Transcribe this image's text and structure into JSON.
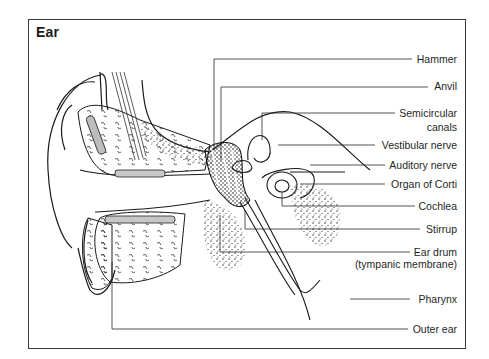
{
  "figure": {
    "title": "Ear",
    "labels": [
      {
        "id": "hammer",
        "text": "Hammer"
      },
      {
        "id": "anvil",
        "text": "Anvil"
      },
      {
        "id": "semicircular-canals",
        "text": "Semicircular",
        "text2": "canals"
      },
      {
        "id": "vestibular-nerve",
        "text": "Vestibular  nerve"
      },
      {
        "id": "auditory-nerve",
        "text": "Auditory nerve"
      },
      {
        "id": "organ-of-corti",
        "text": "Organ  of Corti"
      },
      {
        "id": "cochlea",
        "text": "Cochlea"
      },
      {
        "id": "stirrup",
        "text": "Stirrup"
      },
      {
        "id": "ear-drum",
        "text": "Ear drum",
        "text2": "(tympanic membrane)"
      },
      {
        "id": "pharynx",
        "text": "Pharynx"
      },
      {
        "id": "outer-ear",
        "text": "Outer ear"
      }
    ]
  }
}
